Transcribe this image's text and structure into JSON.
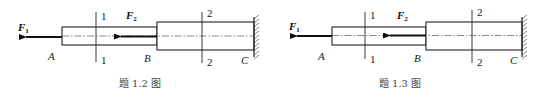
{
  "figures": [
    {
      "id": "1.2",
      "caption": "题 1.2 图",
      "forces": [
        {
          "name": "F",
          "sub": "1"
        },
        {
          "name": "F",
          "sub": "2"
        }
      ],
      "points": [
        "A",
        "B",
        "C"
      ],
      "sections": [
        {
          "top": "1",
          "bottom": "1"
        },
        {
          "top": "2",
          "bottom": "2"
        }
      ]
    },
    {
      "id": "1.3",
      "caption": "题 1.3 图",
      "forces": [
        {
          "name": "F",
          "sub": "1"
        },
        {
          "name": "F",
          "sub": "2"
        }
      ],
      "points": [
        "A",
        "B",
        "C"
      ],
      "sections": [
        {
          "top": "1",
          "bottom": "1"
        },
        {
          "top": "2",
          "bottom": "2"
        }
      ]
    }
  ]
}
